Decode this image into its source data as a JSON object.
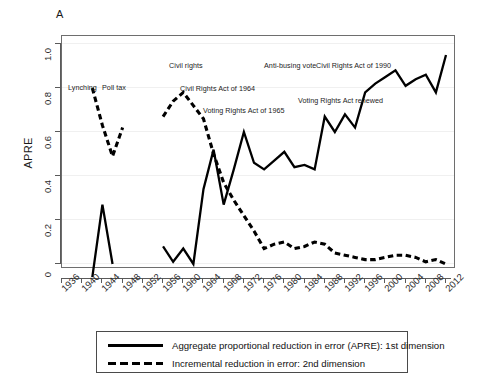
{
  "panel": {
    "letter": "A"
  },
  "axes": {
    "y_title": "APRE",
    "y_ticks": [
      "0",
      "0.2",
      "0.4",
      "0.6",
      "0.8",
      "1.0"
    ],
    "x_ticks": [
      "1936",
      "1940",
      "1944",
      "1948",
      "1952",
      "1956",
      "1960",
      "1964",
      "1968",
      "1972",
      "1976",
      "1980",
      "1984",
      "1988",
      "1992",
      "1996",
      "2000",
      "2004",
      "2008",
      "2012"
    ]
  },
  "annotations": [
    {
      "id": "lynching",
      "text": "Lynching",
      "x": 68,
      "y": 83
    },
    {
      "id": "poll-tax",
      "text": "Poll tax",
      "x": 102,
      "y": 83
    },
    {
      "id": "civil-rights",
      "text": "Civil rights",
      "x": 169,
      "y": 61
    },
    {
      "id": "cra-1964",
      "text": "Civil Rights Act of 1964",
      "x": 180,
      "y": 84
    },
    {
      "id": "vra-1965",
      "text": "Voting Rights Act of 1965",
      "x": 203,
      "y": 106
    },
    {
      "id": "anti-busing",
      "text": "Anti-busing vote",
      "x": 264,
      "y": 61
    },
    {
      "id": "cra-1990",
      "text": "Civil Rights Act of 1990",
      "x": 316,
      "y": 61
    },
    {
      "id": "vra-renewed",
      "text": "Voting Rights Act renewed",
      "x": 298,
      "y": 96
    }
  ],
  "legend": {
    "entries": [
      {
        "id": "apre-1st",
        "style": "solid",
        "label": "Aggregate proportional reduction in error (APRE): 1st dimension"
      },
      {
        "id": "apre-2nd",
        "style": "dashed",
        "label": "Incremental reduction in error: 2nd dimension"
      }
    ]
  },
  "chart_data": {
    "type": "line",
    "title": "",
    "xlabel": "",
    "ylabel": "APRE",
    "xlim": [
      1935,
      2013
    ],
    "ylim": [
      -0.08,
      1.0
    ],
    "grid": true,
    "legend_position": "below-plot",
    "series": [
      {
        "name": "Aggregate proportional reduction in error (APRE): 1st dimension",
        "style": "solid",
        "color": "#000000",
        "points": [
          [
            1942,
            -0.06
          ],
          [
            1944,
            0.27
          ],
          [
            1946,
            0.0
          ],
          [
            1956,
            0.08
          ],
          [
            1958,
            0.01
          ],
          [
            1960,
            0.07
          ],
          [
            1962,
            0.0
          ],
          [
            1964,
            0.34
          ],
          [
            1966,
            0.52
          ],
          [
            1968,
            0.27
          ],
          [
            1970,
            0.43
          ],
          [
            1972,
            0.6
          ],
          [
            1974,
            0.46
          ],
          [
            1976,
            0.43
          ],
          [
            1978,
            0.47
          ],
          [
            1980,
            0.51
          ],
          [
            1982,
            0.44
          ],
          [
            1984,
            0.45
          ],
          [
            1986,
            0.43
          ],
          [
            1988,
            0.67
          ],
          [
            1990,
            0.6
          ],
          [
            1992,
            0.68
          ],
          [
            1994,
            0.62
          ],
          [
            1996,
            0.78
          ],
          [
            1998,
            0.82
          ],
          [
            2000,
            0.85
          ],
          [
            2002,
            0.88
          ],
          [
            2004,
            0.81
          ],
          [
            2006,
            0.84
          ],
          [
            2008,
            0.86
          ],
          [
            2010,
            0.78
          ],
          [
            2012,
            0.95
          ]
        ]
      },
      {
        "name": "Incremental reduction in error: 2nd dimension",
        "style": "dashed",
        "color": "#000000",
        "points": [
          [
            1942,
            0.8
          ],
          [
            1944,
            0.63
          ],
          [
            1946,
            0.49
          ],
          [
            1948,
            0.62
          ],
          [
            1956,
            0.67
          ],
          [
            1958,
            0.74
          ],
          [
            1960,
            0.78
          ],
          [
            1962,
            0.72
          ],
          [
            1964,
            0.66
          ],
          [
            1966,
            0.5
          ],
          [
            1968,
            0.37
          ],
          [
            1970,
            0.29
          ],
          [
            1972,
            0.22
          ],
          [
            1974,
            0.15
          ],
          [
            1976,
            0.07
          ],
          [
            1978,
            0.09
          ],
          [
            1980,
            0.1
          ],
          [
            1982,
            0.07
          ],
          [
            1984,
            0.08
          ],
          [
            1986,
            0.1
          ],
          [
            1988,
            0.09
          ],
          [
            1990,
            0.05
          ],
          [
            1992,
            0.04
          ],
          [
            1994,
            0.03
          ],
          [
            1996,
            0.02
          ],
          [
            1998,
            0.02
          ],
          [
            2000,
            0.03
          ],
          [
            2002,
            0.04
          ],
          [
            2004,
            0.04
          ],
          [
            2006,
            0.03
          ],
          [
            2008,
            0.01
          ],
          [
            2010,
            0.02
          ],
          [
            2012,
            0.0
          ]
        ]
      }
    ]
  }
}
